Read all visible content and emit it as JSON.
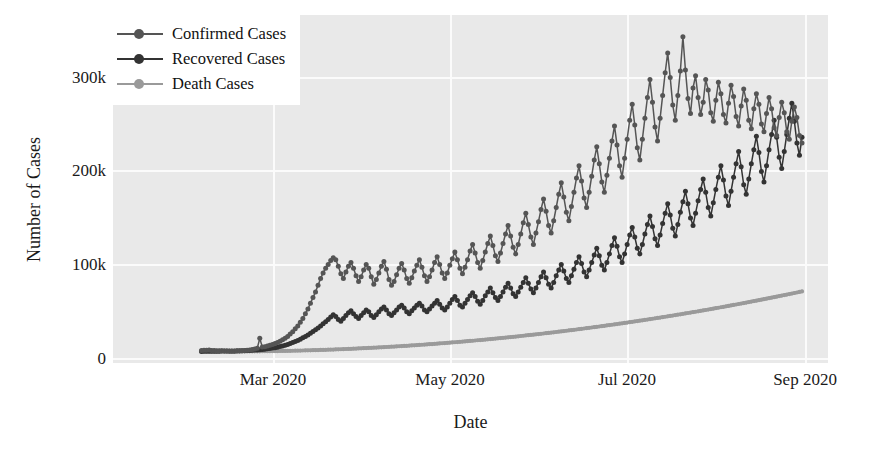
{
  "chart_data": {
    "type": "line",
    "title": "",
    "xlabel": "Date",
    "ylabel": "Number of Cases",
    "grid": true,
    "legend_position": "upper left",
    "xlim": [
      "2020-02-05",
      "2020-09-05"
    ],
    "ylim": [
      -12000,
      355000
    ],
    "ytick_labels": [
      "0",
      "100k",
      "200k",
      "300k"
    ],
    "ytick_values": [
      0,
      100000,
      200000,
      300000
    ],
    "xtick_labels": [
      "Mar 2020",
      "May 2020",
      "Jul 2020",
      "Sep 2020"
    ],
    "xtick_values": [
      "2020-03-01",
      "2020-05-01",
      "2020-07-01",
      "2020-09-01"
    ],
    "colors": {
      "confirmed": "#555555",
      "recovered": "#333333",
      "death": "#9a9a9a",
      "plot_background": "#e9e9e9",
      "grid": "#fbfbfb",
      "figure_background": "#ffffff",
      "text": "#1a1a1a"
    },
    "series": [
      {
        "name": "Confirmed Cases",
        "color": "#555555",
        "values": [
          1200,
          1500,
          1400,
          1600,
          1300,
          1100,
          900,
          1000,
          800,
          700,
          600,
          500,
          450,
          500,
          600,
          700,
          900,
          1100,
          1400,
          1800,
          2200,
          2800,
          3500,
          14000,
          4800,
          5200,
          6000,
          6800,
          7500,
          8500,
          9500,
          11000,
          12500,
          14000,
          16000,
          18500,
          21000,
          24000,
          27000,
          31000,
          35000,
          40000,
          45000,
          51000,
          57000,
          63000,
          70000,
          77000,
          83000,
          88000,
          92000,
          96000,
          99000,
          97000,
          90000,
          82000,
          77000,
          84000,
          90000,
          94000,
          88000,
          80000,
          74000,
          79000,
          86000,
          92000,
          88000,
          79000,
          71000,
          76000,
          83000,
          90000,
          95000,
          87000,
          76000,
          70000,
          74000,
          81000,
          88000,
          93000,
          86000,
          77000,
          72000,
          78000,
          85000,
          91000,
          97000,
          89000,
          80000,
          74000,
          79000,
          86000,
          94000,
          100000,
          92000,
          83000,
          77000,
          83000,
          91000,
          98000,
          105000,
          97000,
          88000,
          82000,
          89000,
          97000,
          106000,
          113000,
          104000,
          94000,
          88000,
          96000,
          105000,
          114000,
          122000,
          112000,
          101000,
          95000,
          104000,
          114000,
          124000,
          133000,
          122000,
          110000,
          103000,
          113000,
          124000,
          136000,
          146000,
          134000,
          121000,
          113000,
          125000,
          137000,
          150000,
          161000,
          148000,
          133000,
          125000,
          138000,
          152000,
          166000,
          178000,
          163000,
          147000,
          138000,
          153000,
          168000,
          183000,
          196000,
          180000,
          162000,
          152000,
          168000,
          185000,
          202000,
          216000,
          198000,
          179000,
          168000,
          186000,
          204000,
          222000,
          238000,
          218000,
          196000,
          184000,
          204000,
          224000,
          244000,
          261000,
          239000,
          215000,
          202000,
          224000,
          246000,
          268000,
          287000,
          263000,
          237000,
          222000,
          246000,
          270000,
          294000,
          315000,
          289000,
          260000,
          244000,
          270000,
          296000,
          332000,
          297000,
          267000,
          251000,
          278000,
          291000,
          268000,
          250000,
          263000,
          287000,
          276000,
          252000,
          243000,
          265000,
          284000,
          272000,
          250000,
          241000,
          262000,
          281000,
          269000,
          248000,
          238000,
          259000,
          277000,
          265000,
          244000,
          235000,
          256000,
          272000,
          261000,
          240000,
          232000,
          251000,
          268000,
          256000,
          236000,
          228000,
          247000,
          263000,
          252000,
          232000,
          224000,
          243000,
          258000,
          247000,
          228000,
          220000
        ]
      },
      {
        "name": "Recovered Cases",
        "color": "#333333",
        "values": [
          200,
          260,
          300,
          340,
          380,
          420,
          460,
          500,
          540,
          580,
          620,
          660,
          700,
          760,
          820,
          880,
          950,
          1050,
          1150,
          1280,
          1420,
          1600,
          1800,
          2050,
          2300,
          2600,
          2900,
          3300,
          3700,
          4200,
          4700,
          5300,
          6000,
          6800,
          7600,
          8500,
          9500,
          10600,
          11800,
          13100,
          14500,
          16000,
          17600,
          19300,
          21100,
          23000,
          25000,
          27100,
          29300,
          31600,
          34000,
          36500,
          39000,
          37000,
          34000,
          32000,
          35000,
          38000,
          41000,
          43000,
          40000,
          37000,
          35000,
          38000,
          41000,
          44000,
          42000,
          38000,
          36000,
          39000,
          42000,
          45000,
          47000,
          44000,
          40000,
          38000,
          41000,
          44000,
          47000,
          49000,
          46000,
          42000,
          40000,
          43000,
          46000,
          49000,
          51000,
          48000,
          44000,
          42000,
          45000,
          48000,
          51000,
          54000,
          50000,
          46000,
          44000,
          47000,
          51000,
          55000,
          58000,
          54000,
          49000,
          47000,
          51000,
          55000,
          59000,
          62000,
          58000,
          53000,
          50000,
          54000,
          59000,
          63000,
          67000,
          62000,
          57000,
          54000,
          58000,
          63000,
          68000,
          72000,
          67000,
          61000,
          58000,
          63000,
          68000,
          73000,
          78000,
          72000,
          66000,
          62000,
          67000,
          73000,
          79000,
          84000,
          78000,
          71000,
          67000,
          73000,
          80000,
          86000,
          92000,
          85000,
          77000,
          73000,
          80000,
          87000,
          94000,
          100000,
          93000,
          84000,
          79000,
          86000,
          94000,
          102000,
          109000,
          101000,
          91000,
          86000,
          94000,
          103000,
          112000,
          120000,
          111000,
          100000,
          94000,
          103000,
          113000,
          123000,
          131000,
          121000,
          109000,
          103000,
          113000,
          124000,
          134000,
          143000,
          132000,
          119000,
          112000,
          123000,
          135000,
          146000,
          156000,
          144000,
          130000,
          122000,
          134000,
          147000,
          158000,
          169000,
          156000,
          141000,
          133000,
          146000,
          159000,
          171000,
          182000,
          168000,
          152000,
          143000,
          157000,
          171000,
          184000,
          196000,
          181000,
          164000,
          154000,
          169000,
          184000,
          198000,
          211000,
          195000,
          176000,
          166000,
          182000,
          198000,
          213000,
          227000,
          210000,
          190000,
          179000,
          196000,
          213000,
          229000,
          244000,
          226000,
          205000,
          193000,
          211000,
          229000,
          246000,
          262000,
          243000,
          220000,
          207000,
          226000
        ]
      },
      {
        "name": "Death Cases",
        "color": "#9a9a9a",
        "values": [
          30,
          40,
          50,
          60,
          70,
          80,
          90,
          100,
          110,
          120,
          130,
          140,
          150,
          160,
          175,
          190,
          205,
          220,
          240,
          260,
          280,
          305,
          330,
          360,
          390,
          420,
          455,
          490,
          530,
          570,
          615,
          660,
          710,
          760,
          815,
          870,
          930,
          990,
          1055,
          1120,
          1190,
          1260,
          1335,
          1410,
          1490,
          1570,
          1655,
          1740,
          1830,
          1920,
          2015,
          2110,
          2210,
          2310,
          2415,
          2520,
          2630,
          2740,
          2855,
          2970,
          3090,
          3210,
          3335,
          3460,
          3590,
          3720,
          3855,
          3990,
          4130,
          4270,
          4415,
          4560,
          4710,
          4860,
          5015,
          5170,
          5330,
          5490,
          5655,
          5820,
          5990,
          6160,
          6335,
          6510,
          6690,
          6870,
          7055,
          7240,
          7430,
          7620,
          7815,
          8010,
          8210,
          8410,
          8615,
          8820,
          9030,
          9240,
          9455,
          9670,
          9890,
          10110,
          10335,
          10560,
          10790,
          11020,
          11255,
          11490,
          11730,
          11970,
          12215,
          12460,
          12710,
          12960,
          13215,
          13470,
          13730,
          13990,
          14255,
          14520,
          14790,
          15060,
          15335,
          15610,
          15890,
          16170,
          16455,
          16740,
          17030,
          17320,
          17615,
          17910,
          18210,
          18510,
          18815,
          19120,
          19430,
          19740,
          20055,
          20370,
          20690,
          21010,
          21335,
          21660,
          21990,
          22320,
          22655,
          22990,
          23330,
          23670,
          24015,
          24360,
          24710,
          25060,
          25415,
          25770,
          26130,
          26490,
          26855,
          27220,
          27590,
          27960,
          28335,
          28710,
          29090,
          29470,
          29855,
          30240,
          30630,
          31020,
          31415,
          31810,
          32210,
          32610,
          33015,
          33420,
          33830,
          34240,
          34655,
          35070,
          35490,
          35910,
          36335,
          36760,
          37190,
          37620,
          38055,
          38490,
          38930,
          39370,
          39815,
          40260,
          40710,
          41160,
          41615,
          42070,
          42530,
          42990,
          43455,
          43920,
          44390,
          44860,
          45335,
          45810,
          46290,
          46770,
          47255,
          47740,
          48230,
          48720,
          49215,
          49710,
          50210,
          50710,
          51215,
          51720,
          52230,
          52740,
          53255,
          53770,
          54290,
          54810,
          55335,
          55860,
          56390,
          56920,
          57455,
          57990,
          58530,
          59070,
          59615,
          60160,
          60710,
          61260,
          61815,
          62370,
          62930,
          63490
        ]
      }
    ]
  },
  "legend": {
    "items": [
      {
        "label": "Confirmed Cases",
        "color": "#555555"
      },
      {
        "label": "Recovered Cases",
        "color": "#333333"
      },
      {
        "label": "Death Cases",
        "color": "#9a9a9a"
      }
    ]
  },
  "axes": {
    "ylabel": "Number of Cases",
    "xlabel": "Date",
    "yticks": [
      "300k",
      "200k",
      "100k",
      "0"
    ],
    "xticks": [
      "Mar 2020",
      "May 2020",
      "Jul 2020",
      "Sep 2020"
    ]
  }
}
